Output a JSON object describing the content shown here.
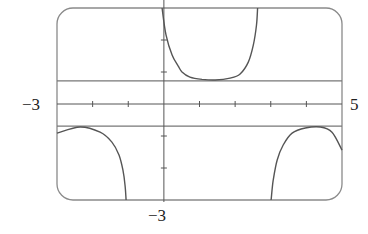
{
  "chart_data": {
    "type": "line",
    "title": "",
    "xlabel": "",
    "ylabel": "",
    "xlim": [
      -3,
      5
    ],
    "ylim": [
      -3,
      3
    ],
    "grid": false,
    "x_tick_step": 1,
    "y_tick_step": 1,
    "axis_labels": {
      "x_min": "−3",
      "x_max": "5",
      "y_min": "−3"
    },
    "horizontal_lines": [
      0.72,
      -0.69
    ],
    "series": [
      {
        "name": "upper-branch",
        "points": [
          [
            -0.05,
            3.0
          ],
          [
            0.06,
            2.16
          ],
          [
            0.23,
            1.53
          ],
          [
            0.4,
            1.19
          ],
          [
            0.51,
            1.0
          ],
          [
            0.73,
            0.84
          ],
          [
            1.07,
            0.77
          ],
          [
            1.44,
            0.75
          ],
          [
            1.86,
            0.81
          ],
          [
            2.14,
            0.94
          ],
          [
            2.37,
            1.31
          ],
          [
            2.51,
            1.84
          ],
          [
            2.6,
            2.47
          ],
          [
            2.63,
            3.0
          ]
        ]
      },
      {
        "name": "lower-left-branch",
        "points": [
          [
            -3.0,
            -0.91
          ],
          [
            -2.35,
            -0.72
          ],
          [
            -1.79,
            -0.88
          ],
          [
            -1.46,
            -1.19
          ],
          [
            -1.26,
            -1.59
          ],
          [
            -1.15,
            -2.06
          ],
          [
            -1.09,
            -2.53
          ],
          [
            -1.06,
            -3.0
          ]
        ]
      },
      {
        "name": "lower-right-branch",
        "points": [
          [
            3.01,
            -3.0
          ],
          [
            3.07,
            -2.38
          ],
          [
            3.18,
            -1.75
          ],
          [
            3.35,
            -1.28
          ],
          [
            3.6,
            -0.91
          ],
          [
            3.97,
            -0.75
          ],
          [
            4.39,
            -0.72
          ],
          [
            4.72,
            -0.88
          ],
          [
            5.0,
            -1.44
          ]
        ]
      }
    ],
    "colors": {
      "frame": "#8a8a8a",
      "curve": "#555555",
      "axis": "#555555",
      "hline": "#777777"
    }
  }
}
